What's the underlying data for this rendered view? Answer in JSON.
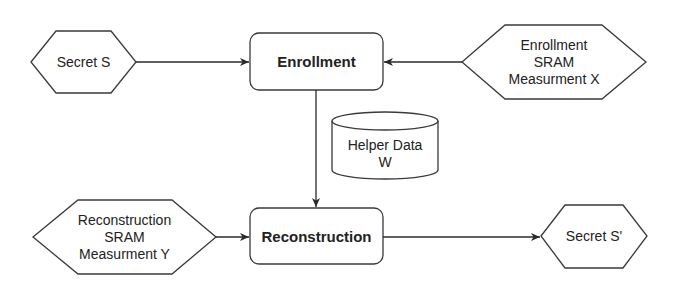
{
  "diagram": {
    "type": "flowchart",
    "colors": {
      "stroke": "#3a3a3a",
      "fill": "#ffffff",
      "text": "#222222"
    },
    "nodes": {
      "secret_s": {
        "shape": "hexagon",
        "lines": [
          "Secret S"
        ]
      },
      "enrollment": {
        "shape": "rounded-rect",
        "lines": [
          "Enrollment"
        ]
      },
      "enroll_sram": {
        "shape": "hexagon",
        "lines": [
          "Enrollment",
          "SRAM",
          "Measurment X"
        ]
      },
      "helper_data": {
        "shape": "cylinder",
        "lines": [
          "Helper Data",
          "W"
        ]
      },
      "recon_sram": {
        "shape": "hexagon",
        "lines": [
          "Reconstruction",
          "SRAM",
          "Measurment Y"
        ]
      },
      "reconstruction": {
        "shape": "rounded-rect",
        "lines": [
          "Reconstruction"
        ]
      },
      "secret_s_prime": {
        "shape": "hexagon",
        "lines": [
          "Secret S'"
        ]
      }
    },
    "edges": [
      {
        "from": "Secret S",
        "to": "Enrollment"
      },
      {
        "from": "Enrollment SRAM Measurment X",
        "to": "Enrollment"
      },
      {
        "from": "Enrollment",
        "to": "Reconstruction"
      },
      {
        "from": "Reconstruction SRAM Measurment Y",
        "to": "Reconstruction"
      },
      {
        "from": "Reconstruction",
        "to": "Secret S'"
      }
    ]
  }
}
